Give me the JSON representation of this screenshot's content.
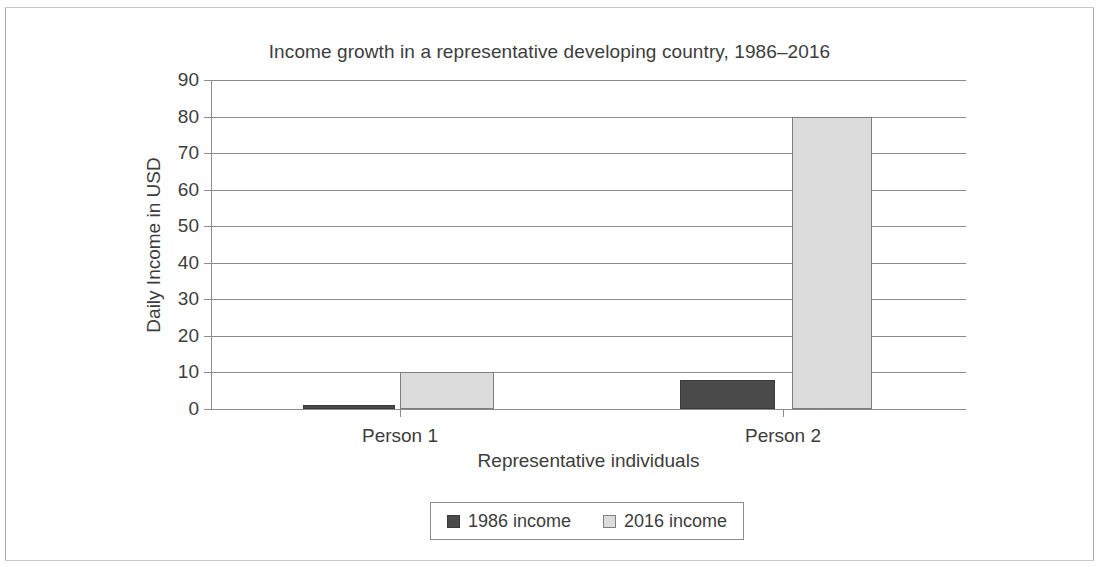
{
  "chart_data": {
    "type": "bar",
    "title": "Income growth in a representative developing country, 1986–2016",
    "xlabel": "Representative individuals",
    "ylabel": "Daily Income in USD",
    "categories": [
      "Person 1",
      "Person 2"
    ],
    "series": [
      {
        "name": "1986 income",
        "values": [
          1,
          8
        ],
        "color": "#4a4a4a"
      },
      {
        "name": "2016 income",
        "values": [
          10,
          80
        ],
        "color": "#dcdcdc"
      }
    ],
    "ylim": [
      0,
      90
    ],
    "ytick_labels": [
      "90",
      "80",
      "70",
      "60",
      "50",
      "40",
      "30",
      "20",
      "10",
      "0"
    ],
    "ytick_values": [
      90,
      80,
      70,
      60,
      50,
      40,
      30,
      20,
      10,
      0
    ],
    "grid": "horizontal",
    "legend_position": "bottom-center"
  },
  "legend": {
    "entries": [
      {
        "label": "1986 income",
        "swatch": "dark-square-swatch"
      },
      {
        "label": "2016 income",
        "swatch": "light-square-swatch"
      }
    ]
  }
}
